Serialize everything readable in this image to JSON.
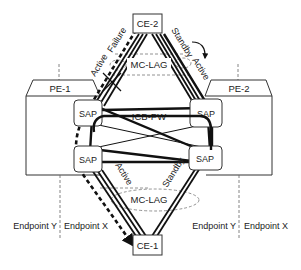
{
  "diagram": {
    "nodes": {
      "ce2": {
        "label": "CE-2"
      },
      "ce1": {
        "label": "CE-1"
      },
      "pe1": {
        "label": "PE-1"
      },
      "pe2": {
        "label": "PE-2"
      },
      "sap_pe1_top": {
        "label": "SAP"
      },
      "sap_pe1_bottom": {
        "label": "SAP"
      },
      "sap_pe2_top": {
        "label": "SAP"
      },
      "sap_pe2_bottom": {
        "label": "SAP"
      }
    },
    "links": {
      "icb_pw": {
        "label": "ICB-PW"
      },
      "mc_lag_top": {
        "label": "MC-LAG"
      },
      "mc_lag_bottom": {
        "label": "MC-LAG"
      }
    },
    "annotations": {
      "top_left_active": "Active",
      "top_left_failure": "Failure",
      "top_right_standby": "Standby",
      "top_right_active": "Active",
      "bottom_left_active": "Active",
      "bottom_right_standby": "Standby"
    },
    "endpoints": {
      "left_y": "Endpoint Y",
      "left_x": "Endpoint X",
      "right_y": "Endpoint Y",
      "right_x": "Endpoint X"
    },
    "colors": {
      "line": "#111111",
      "box_stroke": "#333333",
      "dashed": "#555555"
    }
  }
}
